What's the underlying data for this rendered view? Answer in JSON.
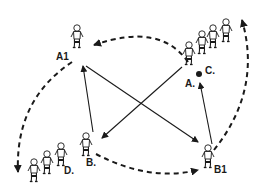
{
  "diagram": {
    "type": "football passing drill",
    "colors": {
      "ink": "#1a1a1a",
      "background": "#ffffff"
    },
    "labels": {
      "a1": "A1",
      "b1": "B1",
      "a": "A.",
      "b": "B.",
      "c": "C.",
      "d": "D."
    },
    "players": [
      {
        "id": "A1",
        "position": "top-left",
        "count": 1
      },
      {
        "id": "C",
        "position": "top-right",
        "count": 4,
        "note": "A. is first player with ball"
      },
      {
        "id": "D",
        "position": "bottom-left",
        "count": 4,
        "note": "B. is first player"
      },
      {
        "id": "B1",
        "position": "bottom-right",
        "count": 1
      }
    ],
    "passes_solid": [
      {
        "from": "A1",
        "to": "B1"
      },
      {
        "from": "B",
        "to": "A1"
      },
      {
        "from": "A",
        "to": "B"
      },
      {
        "from": "B1",
        "to": "A"
      }
    ],
    "runs_dashed": [
      {
        "from": "C",
        "to": "A1"
      },
      {
        "from": "A1",
        "to": "D"
      },
      {
        "from": "B",
        "to": "B1"
      },
      {
        "from": "B1",
        "to": "C"
      }
    ]
  }
}
